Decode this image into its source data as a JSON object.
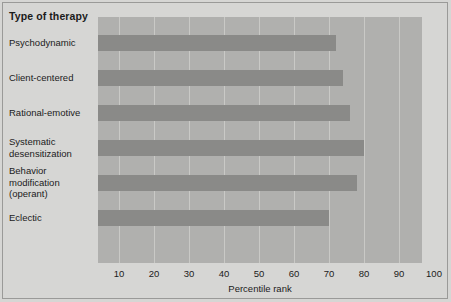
{
  "figure": {
    "category_axis_title": "Type of therapy",
    "x_axis_title": "Percentile rank",
    "background_color": "#d6d6d4",
    "panel_color": "#b0b0ae",
    "bar_color": "#8a8a88",
    "gridline_color": "#c9c9c6"
  },
  "chart_data": {
    "type": "bar",
    "orientation": "horizontal",
    "title": "Type of therapy",
    "xlabel": "Percentile rank",
    "ylabel": "Type of therapy",
    "categories": [
      "Psychodynamic",
      "Client-centered",
      "Rational-emotive",
      "Systematic\ndesensitization",
      "Behavior\nmodification\n(operant)",
      "Eclectic"
    ],
    "values": [
      72,
      74,
      76,
      80,
      78,
      70
    ],
    "xlim": [
      0,
      100
    ],
    "xticks": [
      10,
      20,
      30,
      40,
      50,
      60,
      70,
      80,
      90,
      100
    ],
    "xticklabels": [
      "10",
      "20",
      "30",
      "40",
      "50",
      "60",
      "70",
      "80",
      "90",
      "100"
    ],
    "grid": "vertical",
    "legend": "none"
  }
}
